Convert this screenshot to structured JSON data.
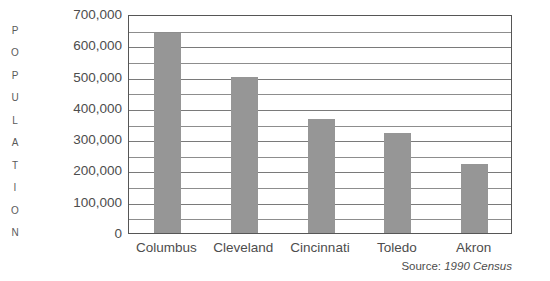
{
  "chart_data": {
    "type": "bar",
    "title": "",
    "subtitle": "",
    "xlabel": "",
    "ylabel": "POPULATION",
    "categories": [
      "Columbus",
      "Cleveland",
      "Cincinnati",
      "Toledo",
      "Akron"
    ],
    "values": [
      640000,
      500000,
      363000,
      320000,
      220000
    ],
    "series": [
      {
        "name": "Population",
        "values": [
          640000,
          500000,
          363000,
          320000,
          220000
        ]
      }
    ],
    "ylim": [
      0,
      700000
    ],
    "y_tick_labels": [
      "700,000",
      "600,000",
      "500,000",
      "400,000",
      "300,000",
      "200,000",
      "100,000",
      "0"
    ],
    "y_tick_values": [
      700000,
      600000,
      500000,
      400000,
      300000,
      200000,
      100000,
      0
    ],
    "y_minor_step": 50000,
    "grid": true,
    "grid_orientation": "horizontal",
    "legend": false,
    "legend_position": "none",
    "bar_color": "#969696",
    "grid_color": "#8d8d8d",
    "axis_color": "#565656",
    "text_color": "#4d4d4d",
    "annotations": {
      "source_prefix": "Source:",
      "source_value": "1990 Census"
    }
  },
  "axis_title": {
    "letters": [
      "P",
      "O",
      "P",
      "U",
      "L",
      "A",
      "T",
      "I",
      "O",
      "N"
    ]
  }
}
